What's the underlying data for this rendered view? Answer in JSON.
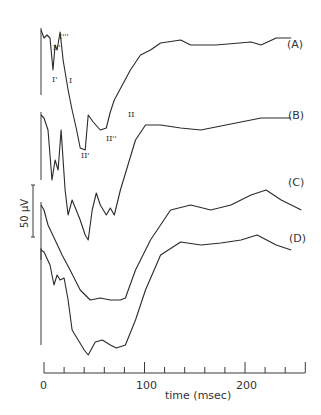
{
  "chart_data": {
    "type": "line",
    "title": "",
    "xlabel": "time (msec)",
    "ylabel": "",
    "xlim": [
      0,
      260
    ],
    "x_ticks": [
      0,
      100,
      200
    ],
    "x_minor_step": 20,
    "grid": false,
    "scale_bar": {
      "label": "50 μV"
    },
    "series": [
      {
        "name": "(A)",
        "peak_labels": [
          "I'",
          "I''",
          "I'''",
          "I",
          "II'",
          "II''",
          "II"
        ],
        "x": [
          -3,
          0,
          3,
          6,
          9,
          11,
          13,
          16,
          19,
          24,
          28,
          32,
          36,
          41,
          44,
          49,
          56,
          62,
          66,
          70,
          86,
          96,
          106,
          116,
          136,
          146,
          171,
          206,
          216,
          231,
          246
        ],
        "y": [
          30,
          38,
          35,
          38,
          70,
          45,
          50,
          32,
          60,
          90,
          110,
          128,
          148,
          150,
          115,
          122,
          130,
          128,
          112,
          100,
          70,
          55,
          50,
          43,
          40,
          45,
          45,
          42,
          45,
          38,
          38
        ]
      },
      {
        "name": "(B)",
        "x": [
          -3,
          0,
          4,
          8,
          11,
          14,
          17,
          21,
          24,
          28,
          32,
          36,
          41,
          44,
          48,
          52,
          56,
          62,
          66,
          70,
          76,
          91,
          101,
          116,
          136,
          156,
          176,
          196,
          216,
          246
        ],
        "y": [
          115,
          118,
          130,
          180,
          160,
          170,
          130,
          190,
          215,
          200,
          210,
          220,
          235,
          240,
          210,
          193,
          205,
          215,
          208,
          215,
          190,
          140,
          125,
          125,
          128,
          130,
          126,
          122,
          118,
          118
        ]
      },
      {
        "name": "(C)",
        "x": [
          -3,
          0,
          4,
          11,
          18,
          26,
          36,
          46,
          56,
          66,
          76,
          81,
          91,
          106,
          126,
          146,
          166,
          186,
          206,
          221,
          236,
          256
        ],
        "y": [
          205,
          210,
          225,
          240,
          255,
          270,
          290,
          300,
          298,
          300,
          300,
          298,
          270,
          240,
          210,
          205,
          210,
          205,
          195,
          190,
          200,
          210
        ]
      },
      {
        "name": "(D)",
        "x": [
          -3,
          0,
          6,
          10,
          13,
          16,
          20,
          24,
          28,
          34,
          40,
          44,
          51,
          58,
          66,
          72,
          81,
          91,
          101,
          116,
          136,
          156,
          176,
          196,
          212,
          231,
          246
        ],
        "y": [
          250,
          252,
          265,
          285,
          275,
          280,
          278,
          300,
          330,
          340,
          350,
          355,
          342,
          340,
          345,
          348,
          345,
          320,
          290,
          255,
          242,
          245,
          243,
          240,
          235,
          245,
          250
        ]
      }
    ],
    "y_units": "pixel positions (traces vertically offset; relative voltage)"
  },
  "labels": {
    "a": "(A)",
    "b": "(B)",
    "c": "(C)",
    "d": "(D)",
    "scale": "50 μV",
    "x_axis_title": "time (msec)",
    "tick_0": "0",
    "tick_100": "100",
    "tick_200": "200",
    "peak_I1": "I'",
    "peak_I2": "I''",
    "peak_I3": "I'''",
    "peak_I": "I",
    "peak_II1": "II'",
    "peak_II2": "II''",
    "peak_II": "II"
  }
}
